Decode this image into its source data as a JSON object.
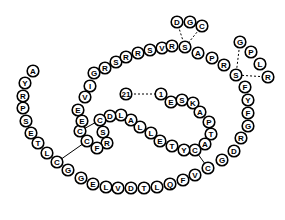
{
  "diagram": {
    "title": "",
    "type": "peptide-sequence-diagram",
    "colors": {
      "stroke": "#000000",
      "fill": "#ffffff"
    },
    "residues": [
      {
        "id": "r21",
        "label": "21",
        "x": 126,
        "y": 94
      },
      {
        "id": "r1",
        "label": "1",
        "x": 161,
        "y": 94
      },
      {
        "id": "rE1",
        "label": "E",
        "x": 171,
        "y": 102
      },
      {
        "id": "rS1",
        "label": "S",
        "x": 182,
        "y": 100
      },
      {
        "id": "rK1",
        "label": "K",
        "x": 193,
        "y": 103
      },
      {
        "id": "rA1",
        "label": "A",
        "x": 200,
        "y": 112
      },
      {
        "id": "rP1",
        "label": "P",
        "x": 209,
        "y": 122
      },
      {
        "id": "rT1",
        "label": "T",
        "x": 211,
        "y": 134
      },
      {
        "id": "rA2",
        "label": "A",
        "x": 205,
        "y": 144
      },
      {
        "id": "rC1",
        "label": "C",
        "x": 195,
        "y": 150
      },
      {
        "id": "rY1",
        "label": "Y",
        "x": 184,
        "y": 150
      },
      {
        "id": "rT2",
        "label": "T",
        "x": 172,
        "y": 146
      },
      {
        "id": "rE2",
        "label": "E",
        "x": 160,
        "y": 141
      },
      {
        "id": "rL1",
        "label": "L",
        "x": 151,
        "y": 133
      },
      {
        "id": "rL2",
        "label": "L",
        "x": 140,
        "y": 127
      },
      {
        "id": "rA3",
        "label": "A",
        "x": 131,
        "y": 120
      },
      {
        "id": "rL3",
        "label": "L",
        "x": 121,
        "y": 115
      },
      {
        "id": "rD1",
        "label": "D",
        "x": 110,
        "y": 116
      },
      {
        "id": "rC2",
        "label": "C",
        "x": 100,
        "y": 120
      },
      {
        "id": "rS2",
        "label": "S",
        "x": 103,
        "y": 132
      },
      {
        "id": "rR1",
        "label": "R",
        "x": 107,
        "y": 143
      },
      {
        "id": "rF1",
        "label": "F",
        "x": 97,
        "y": 148
      },
      {
        "id": "rC3",
        "label": "C",
        "x": 87,
        "y": 141
      },
      {
        "id": "rC4",
        "label": "C",
        "x": 80,
        "y": 131
      },
      {
        "id": "rE3",
        "label": "E",
        "x": 82,
        "y": 121
      },
      {
        "id": "rE4",
        "label": "E",
        "x": 78,
        "y": 110
      },
      {
        "id": "rV1",
        "label": "V",
        "x": 85,
        "y": 97
      },
      {
        "id": "rI1",
        "label": "I",
        "x": 90,
        "y": 86
      },
      {
        "id": "rG1",
        "label": "G",
        "x": 94,
        "y": 73
      },
      {
        "id": "rR2",
        "label": "R",
        "x": 105,
        "y": 68
      },
      {
        "id": "rS3",
        "label": "S",
        "x": 116,
        "y": 62
      },
      {
        "id": "rR3",
        "label": "R",
        "x": 126,
        "y": 57
      },
      {
        "id": "rR4",
        "label": "R",
        "x": 138,
        "y": 53
      },
      {
        "id": "rS4",
        "label": "S",
        "x": 150,
        "y": 50
      },
      {
        "id": "rV2",
        "label": "V",
        "x": 162,
        "y": 48
      },
      {
        "id": "rR5",
        "label": "R",
        "x": 172,
        "y": 46
      },
      {
        "id": "rS5",
        "label": "S",
        "x": 185,
        "y": 47
      },
      {
        "id": "rA4",
        "label": "A",
        "x": 198,
        "y": 53
      },
      {
        "id": "rP2",
        "label": "P",
        "x": 212,
        "y": 58
      },
      {
        "id": "rR6",
        "label": "R",
        "x": 224,
        "y": 65
      },
      {
        "id": "rS6",
        "label": "S",
        "x": 236,
        "y": 75
      },
      {
        "id": "rF2",
        "label": "F",
        "x": 245,
        "y": 87
      },
      {
        "id": "rY2",
        "label": "Y",
        "x": 248,
        "y": 100
      },
      {
        "id": "rF3",
        "label": "F",
        "x": 248,
        "y": 113
      },
      {
        "id": "rG2",
        "label": "G",
        "x": 248,
        "y": 126
      },
      {
        "id": "rR7",
        "label": "R",
        "x": 241,
        "y": 138
      },
      {
        "id": "rD2",
        "label": "D",
        "x": 234,
        "y": 151
      },
      {
        "id": "rG3",
        "label": "G",
        "x": 222,
        "y": 160
      },
      {
        "id": "rC5",
        "label": "C",
        "x": 208,
        "y": 168
      },
      {
        "id": "rV3",
        "label": "V",
        "x": 195,
        "y": 175
      },
      {
        "id": "rF4",
        "label": "F",
        "x": 183,
        "y": 180
      },
      {
        "id": "rQ1",
        "label": "Q",
        "x": 170,
        "y": 184
      },
      {
        "id": "rL4",
        "label": "L",
        "x": 157,
        "y": 187
      },
      {
        "id": "rT3",
        "label": "T",
        "x": 144,
        "y": 188
      },
      {
        "id": "rD3",
        "label": "D",
        "x": 131,
        "y": 188
      },
      {
        "id": "rV4",
        "label": "V",
        "x": 118,
        "y": 188
      },
      {
        "id": "rL5",
        "label": "L",
        "x": 106,
        "y": 187
      },
      {
        "id": "rE5",
        "label": "E",
        "x": 93,
        "y": 184
      },
      {
        "id": "rG4",
        "label": "G",
        "x": 81,
        "y": 178
      },
      {
        "id": "rG5",
        "label": "G",
        "x": 68,
        "y": 170
      },
      {
        "id": "rC6",
        "label": "C",
        "x": 57,
        "y": 162
      },
      {
        "id": "rL6",
        "label": "L",
        "x": 47,
        "y": 153
      },
      {
        "id": "rT4",
        "label": "T",
        "x": 38,
        "y": 143
      },
      {
        "id": "rE6",
        "label": "E",
        "x": 31,
        "y": 133
      },
      {
        "id": "rS7",
        "label": "S",
        "x": 26,
        "y": 121
      },
      {
        "id": "rP3",
        "label": "P",
        "x": 23,
        "y": 108
      },
      {
        "id": "rR8",
        "label": "R",
        "x": 23,
        "y": 96
      },
      {
        "id": "rY3",
        "label": "Y",
        "x": 25,
        "y": 83
      },
      {
        "id": "rA5",
        "label": "A",
        "x": 33,
        "y": 71
      },
      {
        "id": "rD4",
        "label": "D",
        "x": 177,
        "y": 22
      },
      {
        "id": "rG6",
        "label": "G",
        "x": 190,
        "y": 22
      },
      {
        "id": "rC7",
        "label": "C",
        "x": 202,
        "y": 26
      },
      {
        "id": "rG7",
        "label": "G",
        "x": 240,
        "y": 42
      },
      {
        "id": "rP4",
        "label": "P",
        "x": 251,
        "y": 52
      },
      {
        "id": "rL7",
        "label": "L",
        "x": 260,
        "y": 64
      },
      {
        "id": "rR9",
        "label": "R",
        "x": 268,
        "y": 77
      }
    ],
    "solid_links": [
      [
        "rC4",
        "rC1x"
      ],
      [
        "rC2",
        "rC4"
      ],
      [
        "rC3",
        "rC6"
      ],
      [
        "rC1",
        "rC5"
      ]
    ],
    "dashed_links": [
      [
        "r21",
        "r1"
      ],
      [
        "rD4",
        "rS5"
      ],
      [
        "rC7",
        "rS5"
      ],
      [
        "rG7",
        "rS6"
      ],
      [
        "rR9",
        "rS6"
      ]
    ]
  }
}
